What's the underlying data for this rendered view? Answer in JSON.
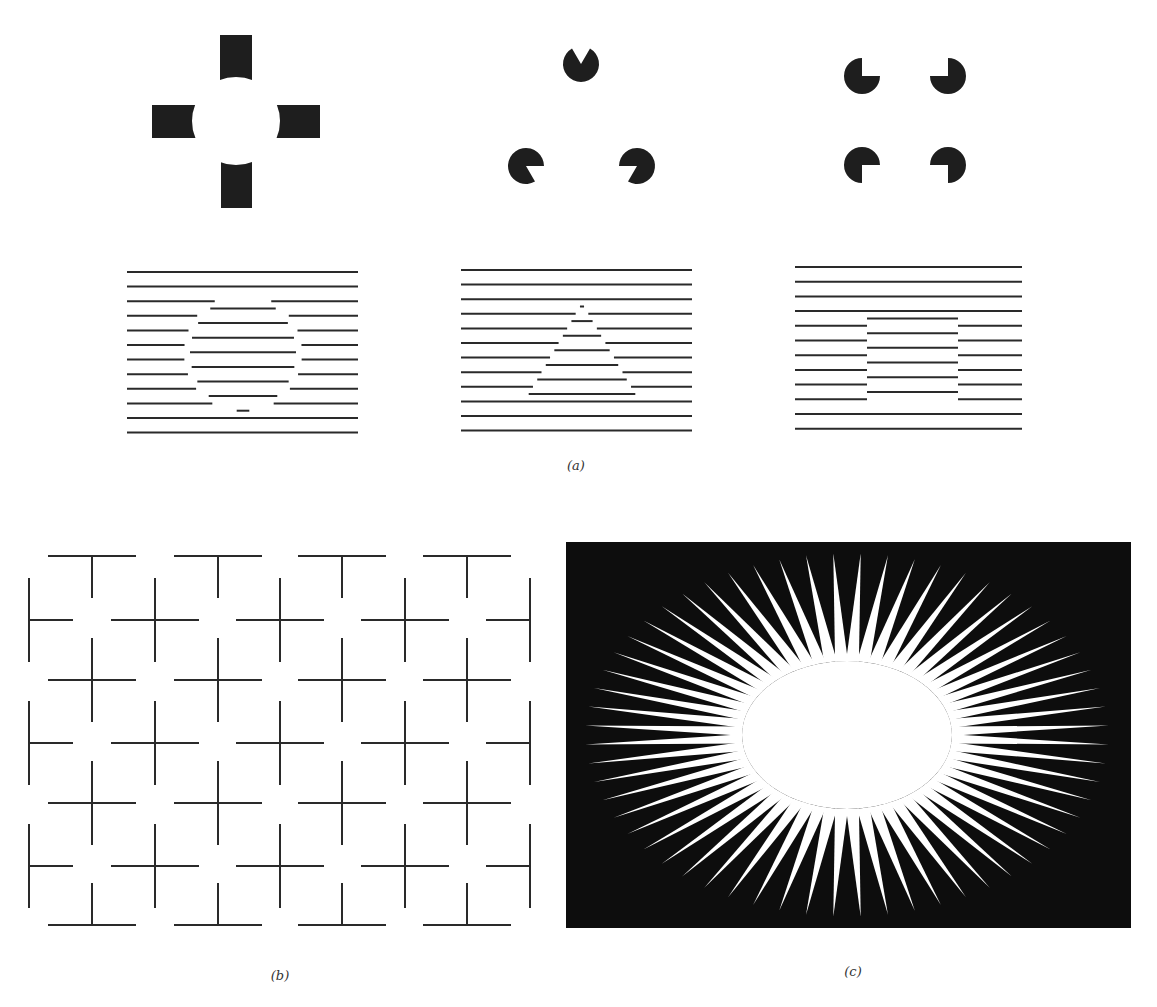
{
  "figure": {
    "panels": [
      {
        "id": "a",
        "caption": "(a)",
        "caption_pos": [
          576,
          458
        ],
        "description": "Illusory contour figures: cross with concave ends (illusory circle), Kanizsa triangle, Kanizsa square, and line-grating phase-shift figures for circle, triangle and square",
        "subfigures": [
          {
            "name": "ehrenstein-cross-circle",
            "kind": "bars",
            "center": [
              236,
              121
            ],
            "bars": [
              {
                "x": 220,
                "y": 35,
                "w": 32,
                "h": 47,
                "notch": "bottom"
              },
              {
                "x": 152,
                "y": 105,
                "w": 45,
                "h": 33,
                "notch": "right"
              },
              {
                "x": 275,
                "y": 105,
                "w": 45,
                "h": 33,
                "notch": "left"
              },
              {
                "x": 221,
                "y": 162,
                "w": 31,
                "h": 46,
                "notch": "top"
              }
            ],
            "illusory_radius": 44
          },
          {
            "name": "kanizsa-triangle",
            "kind": "pacmen",
            "radius": 18,
            "items": [
              {
                "cx": 581,
                "cy": 64,
                "mouth_from": 60,
                "mouth_to": 120
              },
              {
                "cx": 526,
                "cy": 166,
                "mouth_from": -60,
                "mouth_to": 0
              },
              {
                "cx": 637,
                "cy": 166,
                "mouth_from": 180,
                "mouth_to": 240
              }
            ]
          },
          {
            "name": "kanizsa-square",
            "kind": "pacmen",
            "radius": 18,
            "items": [
              {
                "cx": 862,
                "cy": 76,
                "mouth_from": 0,
                "mouth_to": 90
              },
              {
                "cx": 948,
                "cy": 76,
                "mouth_from": 90,
                "mouth_to": 180
              },
              {
                "cx": 862,
                "cy": 165,
                "mouth_from": 270,
                "mouth_to": 360
              },
              {
                "cx": 948,
                "cy": 165,
                "mouth_from": 180,
                "mouth_to": 270
              }
            ]
          },
          {
            "name": "grating-circle",
            "kind": "grating",
            "x0": 127,
            "x1": 358,
            "y0": 272,
            "step": 14.6,
            "count": 12,
            "shape": "circle",
            "shape_params": {
              "cx": 243,
              "cy": 353,
              "r": 59
            }
          },
          {
            "name": "grating-triangle",
            "kind": "grating",
            "x0": 461,
            "x1": 692,
            "y0": 270,
            "step": 14.6,
            "count": 12,
            "shape": "triangle",
            "shape_params": {
              "apex": [
                582,
                303
              ],
              "base_y": 397,
              "base_x0": 527,
              "base_x1": 637
            }
          },
          {
            "name": "grating-square",
            "kind": "grating",
            "x0": 795,
            "x1": 1022,
            "y0": 267,
            "step": 14.7,
            "count": 12,
            "shape": "square",
            "shape_params": {
              "x0": 867,
              "x1": 958,
              "y0": 312,
              "y1": 400
            }
          }
        ]
      },
      {
        "id": "b",
        "caption": "(b)",
        "caption_pos": [
          280,
          968
        ],
        "description": "Grid of crosses with gaps producing illusory circles / bright disks at intersections",
        "grid": {
          "arm_h": 44,
          "arm_v": 42,
          "rows_a": [
            556,
            680,
            803,
            925
          ],
          "cols_a": [
            92,
            218,
            342,
            467
          ],
          "rows_b": [
            620,
            743,
            866
          ],
          "cols_b": [
            29,
            155,
            280,
            405,
            530
          ],
          "left_edge": 29,
          "right_edge": 530,
          "top_edge": 556,
          "bottom_edge": 925
        }
      },
      {
        "id": "c",
        "caption": "(c)",
        "caption_pos": [
          853,
          964
        ],
        "description": "Sunburst of white tapering rays on black producing an illusory bright ellipse",
        "panel_rect": [
          566,
          542,
          1131,
          928
        ],
        "background": "#0d0d0d",
        "ray_color": "#ffffff",
        "center": [
          847,
          735
        ],
        "inner_rx": 105,
        "inner_ry": 74,
        "outer_rx": 262,
        "outer_ry": 182,
        "ray_count": 60,
        "ray_half_width_deg": 2.2
      }
    ],
    "colors": {
      "ink": "#1e1e1e",
      "paper": "#ffffff",
      "line": "#2a2a2a"
    }
  }
}
